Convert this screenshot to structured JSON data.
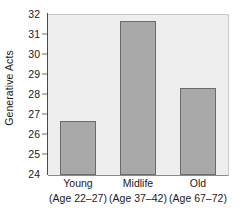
{
  "chart_data": {
    "type": "bar",
    "title": "",
    "subtitle": "",
    "xlabel": "",
    "ylabel": "Generative Acts",
    "categories": [
      "Young",
      "Midlife",
      "Old"
    ],
    "category_sublabels": [
      "(Age 22–27)",
      "(Age 37–42)",
      "(Age 67–72)"
    ],
    "values": [
      26.7,
      31.7,
      28.35
    ],
    "ylim": [
      24,
      32
    ],
    "yticks": [
      24,
      25,
      26,
      27,
      28,
      29,
      30,
      31,
      32
    ],
    "ytick_labels": [
      "24",
      "25",
      "26",
      "27",
      "28",
      "29",
      "30",
      "31",
      "32"
    ],
    "grid": false,
    "legend": null,
    "legend_position": "none",
    "bar_color": "#a9a9a9",
    "bar_edge_color": "#6b6b6b",
    "plot_background": "#eeeeee",
    "axis_color": "#4a4a4a",
    "text_color": "#1a1a1a"
  }
}
